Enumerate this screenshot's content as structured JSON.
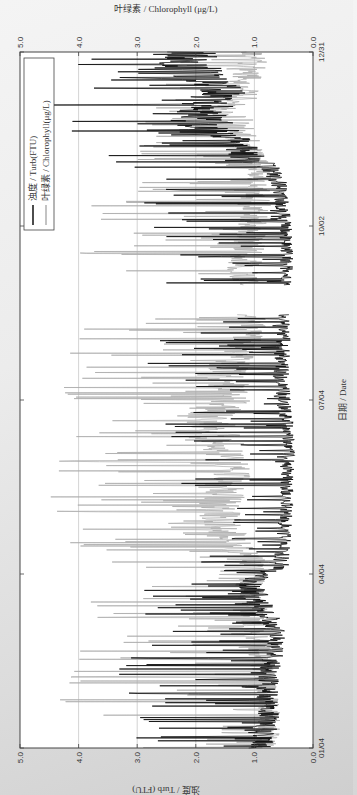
{
  "chart_data": {
    "type": "line",
    "orientation": "rotated-90-ccw",
    "title": "",
    "xlabel": "日期 / Date",
    "ylabel_left": "浊度 / Turb (FTU)",
    "ylabel_right": "叶绿素 / Chlorophyll (μg/L)",
    "x_ticks": [
      "01/04",
      "04/04",
      "07/04",
      "10/02",
      "12/31"
    ],
    "y_ticks_left": [
      "0.0",
      "1.0",
      "2.0",
      "3.0",
      "4.0",
      "5.0"
    ],
    "y_ticks_right": [
      "0.0",
      "1.0",
      "2.0",
      "3.0",
      "4.0",
      "5.0"
    ],
    "ylim_left": [
      0,
      5
    ],
    "ylim_right": [
      0,
      5
    ],
    "grid": true,
    "legend": {
      "position": "upper-right",
      "entries": [
        {
          "label": "浊度 / Turb(FTU)",
          "color": "#000000"
        },
        {
          "label": "叶绿素 / Chlorophyll(μg/L)",
          "color": "#aaaaaa"
        }
      ]
    },
    "gap": {
      "start_day": 225,
      "end_day": 240
    },
    "series": [
      {
        "name": "浊度 / Turb(FTU)",
        "color": "#000000",
        "x_day": [
          0,
          10,
          20,
          30,
          45,
          60,
          75,
          85,
          95,
          110,
          125,
          140,
          155,
          170,
          180,
          195,
          210,
          222,
          245,
          260,
          275,
          290,
          300,
          310,
          320,
          330,
          340,
          350,
          360
        ],
        "baseline": [
          0.9,
          0.8,
          0.75,
          0.8,
          0.7,
          0.6,
          0.9,
          1.1,
          0.55,
          0.5,
          0.45,
          0.45,
          0.4,
          0.45,
          0.5,
          0.55,
          0.5,
          0.5,
          0.45,
          0.45,
          0.5,
          0.55,
          0.7,
          1.2,
          1.6,
          1.9,
          1.5,
          2.0,
          2.2
        ],
        "peak": [
          3.6,
          3.3,
          3.4,
          3.3,
          3.4,
          2.5,
          3.3,
          3.6,
          2.0,
          1.5,
          1.6,
          2.4,
          2.6,
          2.8,
          2.2,
          2.8,
          3.0,
          1.6,
          2.8,
          3.0,
          3.2,
          3.0,
          4.3,
          3.8,
          4.2,
          4.5,
          4.4,
          4.1,
          4.3
        ]
      },
      {
        "name": "叶绿素 / Chlorophyll(μg/L)",
        "color": "#aaaaaa",
        "x_day": [
          0,
          10,
          20,
          30,
          45,
          60,
          75,
          85,
          95,
          110,
          125,
          140,
          155,
          170,
          180,
          195,
          210,
          222,
          245,
          260,
          275,
          290,
          300,
          310,
          320,
          330,
          340,
          350,
          360
        ],
        "baseline": [
          0.8,
          0.75,
          0.75,
          0.8,
          0.9,
          1.0,
          1.0,
          1.1,
          1.0,
          1.5,
          1.6,
          1.4,
          1.5,
          1.8,
          1.4,
          1.5,
          1.2,
          1.0,
          1.2,
          1.1,
          1.0,
          0.9,
          0.9,
          1.1,
          1.3,
          1.4,
          1.2,
          1.1,
          1.0
        ],
        "peak": [
          3.2,
          3.4,
          4.2,
          4.5,
          4.3,
          3.5,
          4.0,
          3.0,
          3.5,
          4.4,
          4.5,
          4.6,
          4.2,
          4.5,
          4.5,
          4.5,
          4.4,
          3.8,
          4.4,
          4.2,
          4.0,
          3.5,
          3.2,
          3.0,
          2.8,
          3.0,
          2.8,
          2.5,
          2.6
        ]
      }
    ]
  }
}
